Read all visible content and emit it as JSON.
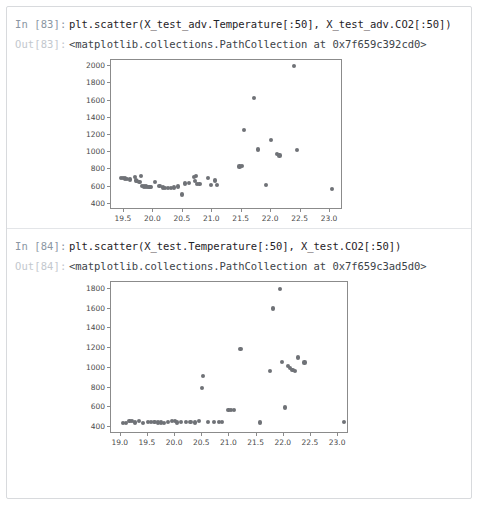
{
  "notebook": {
    "cells": [
      {
        "in_prompt": "In [83]:",
        "code": "plt.scatter(X_test_adv.Temperature[:50], X_test_adv.CO2[:50])",
        "out_prompt": "Out[83]:",
        "out_text": "<matplotlib.collections.PathCollection at 0x7f659c392cd0>"
      },
      {
        "in_prompt": "In [84]:",
        "code": "plt.scatter(X_test.Temperature[:50], X_test.CO2[:50])",
        "out_prompt": "Out[84]:",
        "out_text": "<matplotlib.collections.PathCollection at 0x7f659c3ad5d0>"
      }
    ]
  },
  "colors": {
    "marker": "#6f7277",
    "axis": "#8b8b8b",
    "tick_text": "#4a4a4a",
    "cell_border": "#d8dadd",
    "in_prompt": "#8a96a3",
    "out_prompt": "#c3c8ce"
  },
  "chart_data": [
    {
      "type": "scatter",
      "title": "",
      "xlabel": "",
      "ylabel": "",
      "xlim": [
        19.28,
        23.22
      ],
      "ylim": [
        330,
        2070
      ],
      "xticks": [
        19.5,
        20.0,
        20.5,
        21.0,
        21.5,
        22.0,
        22.5,
        23.0
      ],
      "xticklabels": [
        "19.5",
        "20.0",
        "20.5",
        "21.0",
        "21.5",
        "22.0",
        "22.5",
        "23.0"
      ],
      "yticks": [
        400,
        600,
        800,
        1000,
        1200,
        1400,
        1600,
        1800,
        2000
      ],
      "yticklabels": [
        "400",
        "600",
        "800",
        "1000",
        "1200",
        "1400",
        "1600",
        "1800",
        "2000"
      ],
      "grid": false,
      "legend": false,
      "points": [
        [
          19.46,
          690
        ],
        [
          19.5,
          688
        ],
        [
          19.53,
          683
        ],
        [
          19.57,
          680
        ],
        [
          19.62,
          672
        ],
        [
          19.7,
          700
        ],
        [
          19.72,
          660
        ],
        [
          19.74,
          655
        ],
        [
          19.78,
          645
        ],
        [
          19.8,
          715
        ],
        [
          19.83,
          595
        ],
        [
          19.86,
          592
        ],
        [
          19.89,
          590
        ],
        [
          19.92,
          588
        ],
        [
          19.95,
          586
        ],
        [
          19.98,
          584
        ],
        [
          20.05,
          640
        ],
        [
          20.12,
          598
        ],
        [
          20.18,
          580
        ],
        [
          20.22,
          578
        ],
        [
          20.27,
          576
        ],
        [
          20.31,
          574
        ],
        [
          20.36,
          580
        ],
        [
          20.44,
          592
        ],
        [
          20.5,
          498
        ],
        [
          20.56,
          625
        ],
        [
          20.62,
          628
        ],
        [
          20.7,
          700
        ],
        [
          20.74,
          712
        ],
        [
          20.72,
          655
        ],
        [
          20.76,
          620
        ],
        [
          20.8,
          618
        ],
        [
          20.95,
          690
        ],
        [
          21.0,
          608
        ],
        [
          21.06,
          660
        ],
        [
          21.1,
          604
        ],
        [
          21.48,
          822
        ],
        [
          21.52,
          830
        ],
        [
          21.56,
          1248
        ],
        [
          21.72,
          1615
        ],
        [
          21.8,
          1020
        ],
        [
          21.93,
          612
        ],
        [
          22.02,
          1135
        ],
        [
          22.12,
          965
        ],
        [
          22.16,
          950
        ],
        [
          22.4,
          1985
        ],
        [
          22.46,
          1010
        ],
        [
          23.05,
          560
        ]
      ]
    },
    {
      "type": "scatter",
      "title": "",
      "xlabel": "",
      "ylabel": "",
      "xlim": [
        18.82,
        23.2
      ],
      "ylim": [
        330,
        1870
      ],
      "xticks": [
        19.0,
        19.5,
        20.0,
        20.5,
        21.0,
        21.5,
        22.0,
        22.5,
        23.0
      ],
      "xticklabels": [
        "19.0",
        "19.5",
        "20.0",
        "20.5",
        "21.0",
        "21.5",
        "22.0",
        "22.5",
        "23.0"
      ],
      "yticks": [
        400,
        600,
        800,
        1000,
        1200,
        1400,
        1600,
        1800
      ],
      "yticklabels": [
        "400",
        "600",
        "800",
        "1000",
        "1200",
        "1400",
        "1600",
        "1800"
      ],
      "grid": false,
      "legend": false,
      "points": [
        [
          19.06,
          432
        ],
        [
          19.12,
          434
        ],
        [
          19.18,
          448
        ],
        [
          19.22,
          452
        ],
        [
          19.28,
          436
        ],
        [
          19.36,
          455
        ],
        [
          19.43,
          433
        ],
        [
          19.52,
          440
        ],
        [
          19.58,
          442
        ],
        [
          19.64,
          438
        ],
        [
          19.7,
          436
        ],
        [
          19.76,
          437
        ],
        [
          19.82,
          435
        ],
        [
          19.88,
          441
        ],
        [
          19.96,
          452
        ],
        [
          20.02,
          448
        ],
        [
          20.06,
          436
        ],
        [
          20.12,
          438
        ],
        [
          20.22,
          440
        ],
        [
          20.3,
          444
        ],
        [
          20.38,
          437
        ],
        [
          20.46,
          448
        ],
        [
          20.52,
          790
        ],
        [
          20.53,
          905
        ],
        [
          20.62,
          442
        ],
        [
          20.74,
          440
        ],
        [
          20.82,
          443
        ],
        [
          20.88,
          445
        ],
        [
          21.0,
          560
        ],
        [
          21.04,
          565
        ],
        [
          21.1,
          563
        ],
        [
          21.22,
          1185
        ],
        [
          21.58,
          436
        ],
        [
          21.76,
          960
        ],
        [
          21.82,
          1592
        ],
        [
          21.95,
          1790
        ],
        [
          21.98,
          1050
        ],
        [
          22.04,
          588
        ],
        [
          22.1,
          1005
        ],
        [
          22.14,
          985
        ],
        [
          22.18,
          965
        ],
        [
          22.22,
          955
        ],
        [
          22.28,
          1095
        ],
        [
          22.4,
          1045
        ],
        [
          23.12,
          438
        ]
      ]
    }
  ]
}
